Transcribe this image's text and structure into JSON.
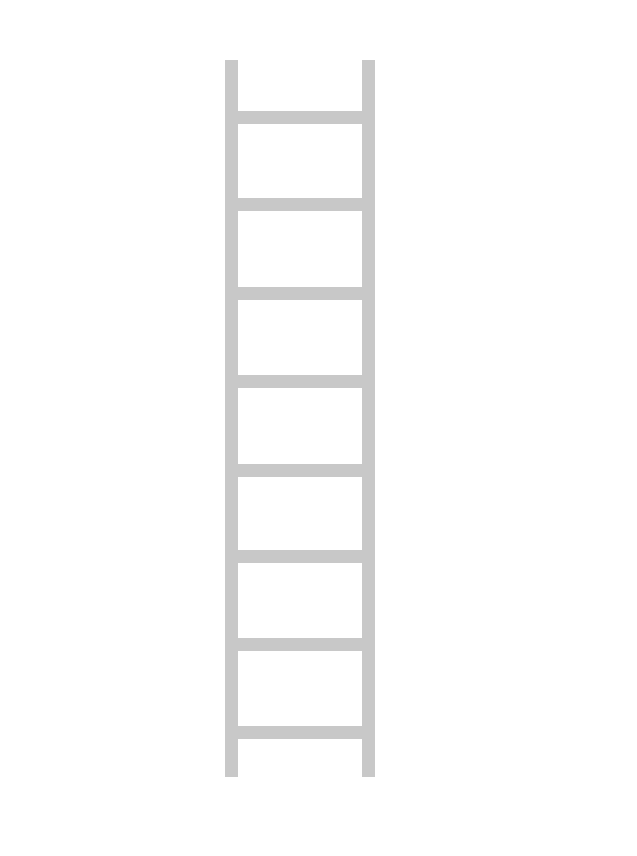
{
  "illustration": {
    "subject": "ladder",
    "color": "#c8c8c8",
    "background": "#ffffff",
    "rails": [
      {
        "name": "left-rail",
        "x": 225,
        "y": 60,
        "width": 13,
        "height": 717
      },
      {
        "name": "right-rail",
        "x": 362,
        "y": 60,
        "width": 13,
        "height": 717
      }
    ],
    "rungs": [
      {
        "y": 111
      },
      {
        "y": 198
      },
      {
        "y": 287
      },
      {
        "y": 375
      },
      {
        "y": 464
      },
      {
        "y": 550
      },
      {
        "y": 638
      },
      {
        "y": 726
      }
    ],
    "rung_count": 8,
    "rung_height": 13
  }
}
